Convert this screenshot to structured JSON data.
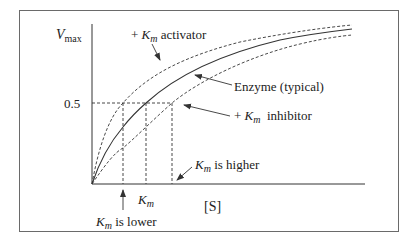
{
  "diagram": {
    "type": "michaelis-menten-curves",
    "y_axis": {
      "label_main": "V",
      "label_sub": "max",
      "tick_label": "0.5"
    },
    "x_axis": {
      "label": "[S]",
      "km_main": "K",
      "km_sub": "m"
    },
    "curves": [
      {
        "name": "activator",
        "style": "dashed",
        "label_prefix": "+ ",
        "label_k": "K",
        "label_sub": "m",
        "label_suffix": " activator"
      },
      {
        "name": "typical",
        "style": "solid",
        "label": "Enzyme (typical)"
      },
      {
        "name": "inhibitor",
        "style": "dashed",
        "label_prefix": "+ ",
        "label_k": "K",
        "label_sub": "m",
        "label_suffix": "  inhibitor"
      }
    ],
    "annotations": {
      "lower": {
        "k": "K",
        "sub": "m",
        "text": " is lower"
      },
      "higher": {
        "k": "K",
        "sub": "m",
        "text": " is higher"
      }
    },
    "colors": {
      "line": "#333333",
      "frame": "#6a6a6a"
    }
  }
}
